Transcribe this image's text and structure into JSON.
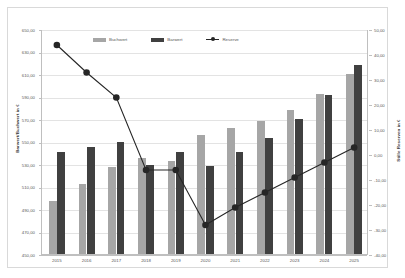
{
  "chart_data": {
    "type": "bar",
    "title": "",
    "subtitle": "",
    "xlabel": "",
    "ylabel": "Barwert/Buchwert in €",
    "y2label": "Stille Reserven in €",
    "categories": [
      "2015",
      "2016",
      "2017",
      "2018",
      "2019",
      "2020",
      "2021",
      "2022",
      "2023",
      "2024",
      "2025"
    ],
    "ylim": [
      450.0,
      650.0
    ],
    "ytick_step": 20.0,
    "y2lim": [
      -40.0,
      50.0
    ],
    "y2tick_step": 10.0,
    "grid": true,
    "legend_position": "top-center",
    "yticks": [
      "650,00",
      "630,00",
      "610,00",
      "590,00",
      "570,00",
      "550,00",
      "530,00",
      "510,00",
      "490,00",
      "470,00",
      "450,00"
    ],
    "y2ticks": [
      "50,00",
      "40,00",
      "30,00",
      "20,00",
      "10,00",
      "0,00",
      "-10,00",
      "-20,00",
      "-30,00",
      "-40,00"
    ],
    "series": [
      {
        "name": "Buchwert",
        "type": "bar",
        "axis": "left",
        "color": "#a6a6a6",
        "values": [
          497.0,
          512.0,
          527.0,
          535.0,
          533.0,
          556.0,
          562.0,
          568.0,
          578.0,
          592.0,
          610.0
        ]
      },
      {
        "name": "Barwert",
        "type": "bar",
        "axis": "left",
        "color": "#404040",
        "values": [
          541.0,
          545.0,
          550.0,
          529.0,
          541.0,
          528.0,
          541.0,
          553.0,
          570.0,
          591.0,
          618.0
        ]
      },
      {
        "name": "Reserve",
        "type": "line",
        "axis": "right",
        "color": "#262626",
        "values": [
          44.0,
          33.0,
          23.0,
          -6.0,
          -6.0,
          -28.0,
          -21.0,
          -15.0,
          -9.0,
          -3.0,
          3.0
        ]
      }
    ]
  },
  "legend": {
    "items": [
      {
        "label": "Buchwert",
        "marker": "buch"
      },
      {
        "label": "Barwert",
        "marker": "bar2"
      },
      {
        "label": "Reserve",
        "marker": "line"
      }
    ]
  }
}
